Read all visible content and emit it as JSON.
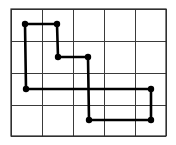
{
  "diagram": {
    "type": "grid-polygon",
    "grid": {
      "columns": 5,
      "rows": 4,
      "x_lines": [
        11,
        42,
        73,
        104,
        135,
        166
      ],
      "y_lines": [
        9,
        41,
        73,
        105,
        136
      ],
      "line_color": "#3a3a3a"
    },
    "path": {
      "color": "#000000",
      "closed": true,
      "vertices": [
        {
          "x": 25,
          "y": 24
        },
        {
          "x": 57,
          "y": 24
        },
        {
          "x": 58,
          "y": 57
        },
        {
          "x": 88,
          "y": 57
        },
        {
          "x": 89,
          "y": 120
        },
        {
          "x": 151,
          "y": 120
        },
        {
          "x": 151,
          "y": 89
        },
        {
          "x": 26,
          "y": 89
        }
      ]
    },
    "vertex_radius": 3.2
  }
}
